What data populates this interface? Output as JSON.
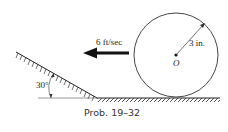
{
  "diagram": {
    "velocity_label": "6 ft/sec",
    "radius_label": "3 in.",
    "center_label": "O",
    "angle_label": "30°",
    "caption": "Prob. 19–32"
  },
  "colors": {
    "ink": "#222222",
    "background": "#ffffff"
  }
}
